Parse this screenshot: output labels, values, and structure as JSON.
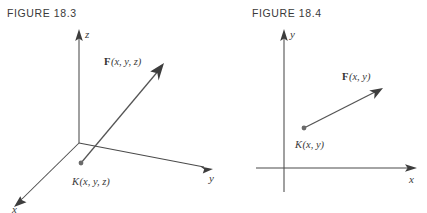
{
  "figures": {
    "left": {
      "caption": "FIGURE 18.3",
      "axes": [
        {
          "name": "z-axis",
          "label": "z"
        },
        {
          "name": "y-axis",
          "label": "y"
        },
        {
          "name": "x-axis",
          "label": "x"
        }
      ],
      "vector_label_bold": "F",
      "vector_label_args": "(x, y, z)",
      "point_label_italic": "K",
      "point_label_args": "(x, y, z)"
    },
    "right": {
      "caption": "FIGURE 18.4",
      "axes": [
        {
          "name": "y-axis",
          "label": "y"
        },
        {
          "name": "x-axis",
          "label": "x"
        }
      ],
      "vector_label_bold": "F",
      "vector_label_args": "(x, y)",
      "point_label_italic": "K",
      "point_label_args": "(x, y)"
    }
  },
  "colors": {
    "background": "#ffffff",
    "axis": "#4a4a4a",
    "vector": "#545454",
    "arrowhead": "#3d3d3d",
    "point": "#6a6a6a",
    "caption_text": "#3a3a3a"
  }
}
